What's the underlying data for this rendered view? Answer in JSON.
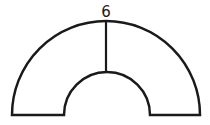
{
  "diagram": {
    "shape": "half-annulus",
    "labels": {
      "thickness": "6"
    },
    "stroke_color": "#1a1a1a"
  }
}
